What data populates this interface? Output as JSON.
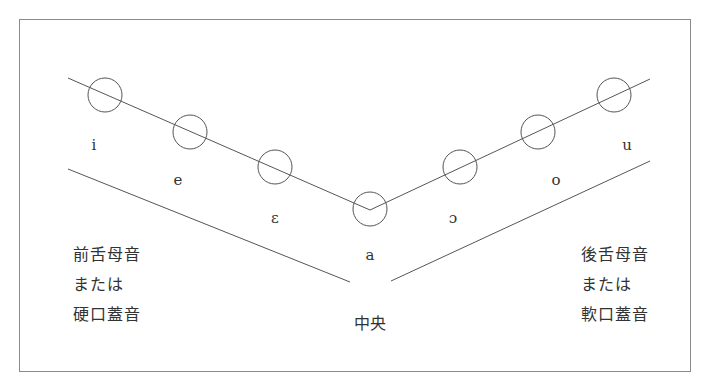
{
  "diagram": {
    "colors": {
      "stroke": "#555555",
      "frame": "#8a8a8a",
      "text": "#333333"
    },
    "vowels": [
      {
        "symbol": "i",
        "circle": [
          105,
          95
        ],
        "label": [
          94,
          145
        ]
      },
      {
        "symbol": "e",
        "circle": [
          190,
          132
        ],
        "label": [
          178,
          180
        ]
      },
      {
        "symbol": "ɛ",
        "circle": [
          275,
          167
        ],
        "label": [
          275,
          218
        ]
      },
      {
        "symbol": "a",
        "circle": [
          370,
          209
        ],
        "label": [
          370,
          255
        ]
      },
      {
        "symbol": "ɔ",
        "circle": [
          460,
          167
        ],
        "label": [
          453,
          218
        ]
      },
      {
        "symbol": "o",
        "circle": [
          538,
          132
        ],
        "label": [
          556,
          180
        ]
      },
      {
        "symbol": "u",
        "circle": [
          614,
          95
        ],
        "label": [
          627,
          145
        ]
      }
    ],
    "left_block": {
      "lines": [
        "前舌母音",
        "または",
        "硬口蓋音"
      ]
    },
    "right_block": {
      "lines": [
        "後舌母音",
        "または",
        "軟口蓋音"
      ]
    },
    "center_label": "中央"
  }
}
